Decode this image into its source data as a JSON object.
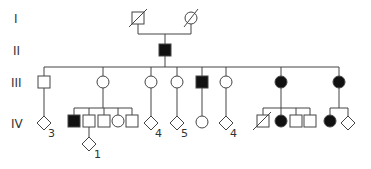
{
  "generations": [
    "I",
    "II",
    "III",
    "IV"
  ],
  "colors": {
    "line": "#444444",
    "affected": "#111111",
    "unaffected": "#ffffff"
  },
  "individuals": [
    {
      "id": "I-1",
      "gen": "I",
      "sex": "male",
      "affected": false,
      "deceased": true,
      "x": 138,
      "y": 18
    },
    {
      "id": "I-2",
      "gen": "I",
      "sex": "female",
      "affected": false,
      "deceased": true,
      "x": 191,
      "y": 18
    },
    {
      "id": "II-1",
      "gen": "II",
      "sex": "male",
      "affected": true,
      "deceased": false,
      "x": 165,
      "y": 50
    },
    {
      "id": "III-1",
      "gen": "III",
      "sex": "male",
      "affected": false,
      "x": 44,
      "y": 82
    },
    {
      "id": "III-2",
      "gen": "III",
      "sex": "female",
      "affected": false,
      "x": 103,
      "y": 82
    },
    {
      "id": "III-3",
      "gen": "III",
      "sex": "female",
      "affected": false,
      "x": 151,
      "y": 82
    },
    {
      "id": "III-4",
      "gen": "III",
      "sex": "female",
      "affected": false,
      "x": 177,
      "y": 82
    },
    {
      "id": "III-5",
      "gen": "III",
      "sex": "male",
      "affected": true,
      "x": 202,
      "y": 82
    },
    {
      "id": "III-6",
      "gen": "III",
      "sex": "female",
      "affected": false,
      "x": 226,
      "y": 82
    },
    {
      "id": "III-7",
      "gen": "III",
      "sex": "female",
      "affected": true,
      "x": 281,
      "y": 82
    },
    {
      "id": "III-8",
      "gen": "III",
      "sex": "female",
      "affected": true,
      "x": 339,
      "y": 82
    },
    {
      "id": "IV-1",
      "gen": "IV",
      "sex": "unknown",
      "affected": false,
      "count": "3",
      "x": 44,
      "y": 123
    },
    {
      "id": "IV-2",
      "gen": "IV",
      "sex": "male",
      "affected": true,
      "x": 74,
      "y": 121
    },
    {
      "id": "IV-3",
      "gen": "IV",
      "sex": "male",
      "affected": false,
      "x": 89,
      "y": 121
    },
    {
      "id": "IV-4",
      "gen": "IV",
      "sex": "male",
      "affected": false,
      "x": 104,
      "y": 121
    },
    {
      "id": "IV-5",
      "gen": "IV",
      "sex": "female",
      "affected": false,
      "x": 118,
      "y": 121
    },
    {
      "id": "IV-6",
      "gen": "IV",
      "sex": "male",
      "affected": false,
      "x": 132,
      "y": 121
    },
    {
      "id": "IV-7",
      "gen": "IV",
      "sex": "unknown",
      "affected": false,
      "count": "4",
      "x": 151,
      "y": 123
    },
    {
      "id": "IV-8",
      "gen": "IV",
      "sex": "unknown",
      "affected": false,
      "count": "5",
      "x": 177,
      "y": 123
    },
    {
      "id": "IV-9",
      "gen": "IV",
      "sex": "female",
      "affected": false,
      "x": 202,
      "y": 122
    },
    {
      "id": "IV-10",
      "gen": "IV",
      "sex": "unknown",
      "affected": false,
      "count": "4",
      "x": 226,
      "y": 123
    },
    {
      "id": "IV-11",
      "gen": "IV",
      "sex": "male",
      "affected": false,
      "deceased": true,
      "x": 263,
      "y": 121
    },
    {
      "id": "IV-12",
      "gen": "IV",
      "sex": "female",
      "affected": true,
      "x": 281,
      "y": 121
    },
    {
      "id": "IV-13",
      "gen": "IV",
      "sex": "male",
      "affected": false,
      "x": 296,
      "y": 121
    },
    {
      "id": "IV-14",
      "gen": "IV",
      "sex": "male",
      "affected": false,
      "x": 310,
      "y": 121
    },
    {
      "id": "IV-15",
      "gen": "IV",
      "sex": "female",
      "affected": true,
      "x": 330,
      "y": 121
    },
    {
      "id": "IV-16",
      "gen": "IV",
      "sex": "unknown",
      "affected": false,
      "x": 348,
      "y": 123
    },
    {
      "id": "V-1",
      "gen": "V",
      "sex": "unknown",
      "affected": false,
      "count": "1",
      "x": 89,
      "y": 144
    }
  ],
  "count_labels": {
    "iv1": "3",
    "iv7": "4",
    "iv8": "5",
    "iv10": "4",
    "v1": "1"
  }
}
